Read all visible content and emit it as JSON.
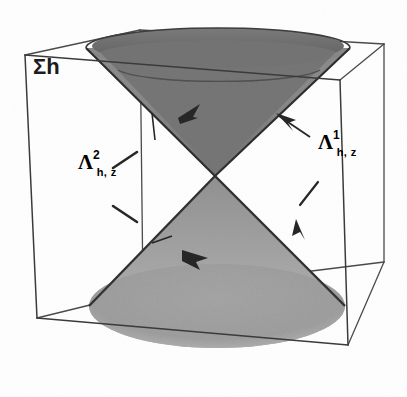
{
  "figure": {
    "background_color": "#fdfdfd",
    "line_color": "#3a3a3a",
    "cone_upper_fill": "#8c8c8c",
    "cone_upper_interior_fill": "#6e6e6e",
    "cone_lower_fill": "#a8a8a8",
    "cone_lower_base_fill": "#9a9a9a",
    "edge_dark": "#2b2b2b"
  },
  "labels": {
    "sigma_h": "Σh",
    "lambda_left": {
      "base": "Λ",
      "superscript": "2",
      "subscript": "h, z"
    },
    "lambda_right": {
      "base": "Λ",
      "superscript": "1",
      "subscript": "h, z"
    }
  },
  "annotations": {
    "arrow_upper_cone_label": "arrow-to-upper-cone-inner",
    "arrow_upper_right_label": "arrow-to-upper-cone-right",
    "arrow_lower_cone_label": "arrow-to-lower-cone-inner",
    "arrow_lower_right_label": "arrow-to-lower-cone-right",
    "leader_left_upper_label": "leader-dash-upper-left",
    "leader_left_lower_label": "leader-dash-lower-left"
  },
  "geometry": {
    "cube": {
      "front_top_left": [
        25,
        55
      ],
      "front_top_right": [
        340,
        80
      ],
      "front_bottom_left": [
        37,
        318
      ],
      "front_bottom_right": [
        348,
        345
      ],
      "back_top_left": [
        140,
        30
      ],
      "back_top_right": [
        384,
        44
      ],
      "back_bottom_left": [
        143,
        292
      ],
      "back_bottom_right": [
        384,
        262
      ]
    },
    "cone_apex": [
      215,
      176
    ],
    "upper_rim": {
      "center": [
        218,
        48
      ],
      "rx": 132,
      "ry": 20
    },
    "lower_rim": {
      "center": [
        217,
        306
      ],
      "rx": 128,
      "ry": 42
    }
  }
}
